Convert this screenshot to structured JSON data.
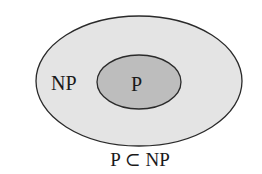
{
  "diagram": {
    "outer_set": {
      "label": "NP",
      "fill": "#e4e4e4",
      "stroke": "#2a2a2a"
    },
    "inner_set": {
      "label": "P",
      "fill": "#bdbdbd",
      "stroke": "#2a2a2a"
    },
    "caption": "P ⊂ NP"
  }
}
